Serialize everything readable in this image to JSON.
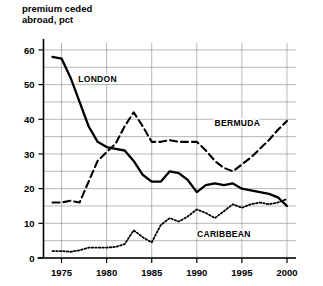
{
  "chart_data": {
    "type": "line",
    "title": "premium ceded\nabroad, pct",
    "title_line1": "premium ceded",
    "title_line2": "abroad, pct",
    "xlabel": "",
    "ylabel": "premium ceded abroad, pct",
    "xlim": [
      1973,
      2001
    ],
    "ylim": [
      0,
      62
    ],
    "grid": true,
    "grid_step_minor": 5,
    "legend_position": "inline-annotations",
    "yticks": [
      0,
      10,
      20,
      30,
      40,
      50,
      60
    ],
    "ytick_labels": [
      "0",
      "10",
      "20",
      "30",
      "40",
      "50",
      "60"
    ],
    "xticks": [
      1975,
      1980,
      1985,
      1990,
      1995,
      2000
    ],
    "xtick_labels": [
      "1975",
      "1980",
      "1985",
      "1990",
      "1995",
      "2000"
    ],
    "x": [
      1974,
      1975,
      1976,
      1977,
      1978,
      1979,
      1980,
      1981,
      1982,
      1983,
      1984,
      1985,
      1986,
      1987,
      1988,
      1989,
      1990,
      1991,
      1992,
      1993,
      1994,
      1995,
      1996,
      1997,
      1998,
      1999,
      2000
    ],
    "series": [
      {
        "name": "LONDON",
        "style": "solid",
        "color": "#000000",
        "label_x": 1979.0,
        "label_y": 51.5,
        "values": [
          58.0,
          57.5,
          52.0,
          45.0,
          38.0,
          33.5,
          32.0,
          31.5,
          31.0,
          28.0,
          24.0,
          22.0,
          22.0,
          25.0,
          24.5,
          22.5,
          19.0,
          21.0,
          21.5,
          21.0,
          21.5,
          20.0,
          19.5,
          19.0,
          18.5,
          17.5,
          15.0
        ]
      },
      {
        "name": "BERMUDA",
        "style": "dashed",
        "color": "#000000",
        "label_x": 1994.5,
        "label_y": 39.0,
        "values": [
          16.0,
          16.0,
          16.5,
          16.0,
          22.0,
          28.0,
          30.5,
          33.0,
          38.0,
          42.0,
          38.0,
          33.5,
          33.5,
          34.0,
          33.5,
          33.5,
          33.5,
          31.0,
          28.0,
          26.0,
          25.0,
          27.0,
          29.0,
          31.5,
          34.0,
          37.0,
          39.5
        ]
      },
      {
        "name": "CARIBBEAN",
        "style": "dotted",
        "color": "#000000",
        "label_x": 1993.0,
        "label_y": 7.0,
        "values": [
          2.0,
          2.0,
          1.8,
          2.2,
          3.0,
          3.0,
          3.0,
          3.2,
          4.0,
          8.0,
          6.0,
          4.5,
          9.5,
          11.5,
          10.5,
          12.0,
          14.0,
          13.0,
          11.5,
          13.5,
          15.5,
          14.5,
          15.5,
          16.0,
          15.5,
          16.0,
          17.0
        ]
      }
    ]
  }
}
